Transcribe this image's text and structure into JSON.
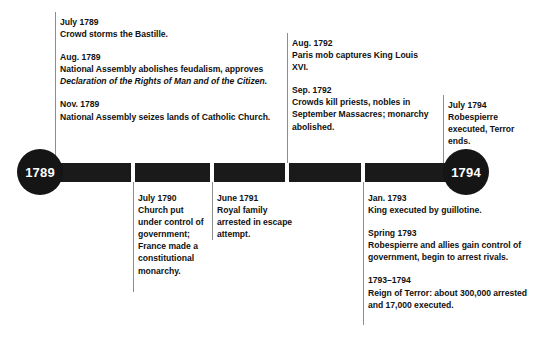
{
  "timeline": {
    "start_label": "1789",
    "end_label": "1794",
    "bar_color": "#1a1a1a",
    "connector_color": "#8d8d8d",
    "text_color": "#111111",
    "background": "#ffffff"
  },
  "above": [
    {
      "group": "group-1789",
      "entries": [
        {
          "date": "July 1789",
          "desc": "Crowd storms the Bastille."
        },
        {
          "date": "Aug. 1789",
          "desc": "National Assembly abolishes feudalism, approves ",
          "desc_italic": "Declaration of the Rights of Man and of the Citizen."
        },
        {
          "date": "Nov. 1789",
          "desc": "National Assembly seizes lands of Catholic Church."
        }
      ]
    },
    {
      "group": "group-1792",
      "entries": [
        {
          "date": "Aug. 1792",
          "desc": "Paris mob captures King Louis XVI."
        },
        {
          "date": "Sep. 1792",
          "desc": "Crowds kill priests, nobles in September Massacres; monarchy abolished."
        }
      ]
    },
    {
      "group": "group-1794",
      "entries": [
        {
          "date": "July 1794",
          "desc": "Robespierre executed, Terror ends."
        }
      ]
    }
  ],
  "below": [
    {
      "group": "group-1790",
      "entries": [
        {
          "date": "July 1790",
          "desc": "Church put under control of government; France made a constitutional monarchy."
        }
      ]
    },
    {
      "group": "group-1791",
      "entries": [
        {
          "date": "June 1791",
          "desc": "Royal family arrested in escape attempt."
        }
      ]
    },
    {
      "group": "group-1793",
      "entries": [
        {
          "date": "Jan. 1793",
          "desc": "King executed by guillotine."
        },
        {
          "date": "Spring 1793",
          "desc": "Robespierre and allies gain control of government, begin to arrest rivals."
        },
        {
          "date": "1793–1794",
          "desc": "Reign of Terror: about 300,000 arrested and 17,000 executed."
        }
      ]
    }
  ]
}
